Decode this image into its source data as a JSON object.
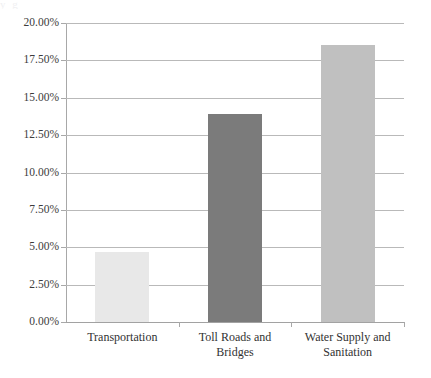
{
  "artifact": {
    "top_text_remnant": "y                                    g"
  },
  "chart_data": {
    "type": "bar",
    "title": "",
    "subtitle": "",
    "xlabel": "",
    "ylabel": "",
    "categories": [
      "Transportation",
      "Toll Roads and Bridges",
      "Water Supply and Sanitation"
    ],
    "category_lines": [
      [
        "Transportation"
      ],
      [
        "Toll Roads and",
        "Bridges"
      ],
      [
        "Water Supply and",
        "Sanitation"
      ]
    ],
    "values": [
      4.7,
      13.9,
      18.5
    ],
    "value_labels": [
      "4.70%",
      "13.90%",
      "18.50%"
    ],
    "bar_colors": [
      "#e8e8e8",
      "#7b7b7b",
      "#c0c0c0"
    ],
    "ylim": [
      0,
      20
    ],
    "ytick_step": 2.5,
    "ytick_values": [
      0,
      2.5,
      5,
      7.5,
      10,
      12.5,
      15,
      17.5,
      20
    ],
    "ytick_labels": [
      "0.00%",
      "2.50%",
      "5.00%",
      "7.50%",
      "10.00%",
      "12.50%",
      "15.00%",
      "17.50%",
      "20.00%"
    ],
    "grid": true,
    "grid_axis": "y",
    "legend": false,
    "legend_position": "none",
    "annotations": []
  },
  "colors": {
    "gridline": "#b9b9b9",
    "axis": "#a2a2a2",
    "text": "#3a3a3a",
    "background": "#ffffff"
  }
}
